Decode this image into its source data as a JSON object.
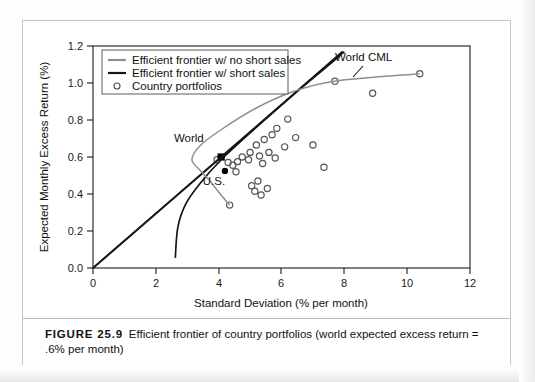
{
  "figure": {
    "caption_label": "FIGURE 25.9",
    "caption_text": "Efficient frontier of country portfolios (world expected excess return = .6% per month)"
  },
  "chart_data": {
    "type": "scatter",
    "title": "",
    "xlabel": "Standard Deviation (% per month)",
    "ylabel": "Expected Monthly Excess Return (%)",
    "xlim": [
      0,
      12
    ],
    "ylim": [
      0.0,
      1.2
    ],
    "xticks": [
      0,
      2,
      4,
      6,
      8,
      10,
      12
    ],
    "xtick_labels": [
      "0",
      "2",
      "4",
      "6",
      "8",
      "10",
      "12"
    ],
    "yticks": [
      0.0,
      0.2,
      0.4,
      0.6,
      0.8,
      1.0,
      1.2
    ],
    "ytick_labels": [
      "0.0",
      "0.2",
      "0.4",
      "0.6",
      "0.8",
      "1.0",
      "1.2"
    ],
    "grid": false,
    "legend_position": "upper-left",
    "legend": [
      {
        "label": "Efficient frontier w/ no short sales",
        "marker": "line",
        "color": "#8e8e8e"
      },
      {
        "label": "Efficient frontier w/ short sales",
        "marker": "line",
        "color": "#151515"
      },
      {
        "label": "Country portfolios",
        "marker": "circle",
        "color": "#4a4a4a"
      }
    ],
    "annotations": [
      {
        "text": "World CML",
        "x": 7.7,
        "y": 1.12
      },
      {
        "text": "World",
        "x": 3.05,
        "y": 0.68
      },
      {
        "text": "U.S.",
        "x": 3.85,
        "y": 0.45
      }
    ],
    "series": [
      {
        "name": "Country portfolios",
        "type": "scatter",
        "marker": "open-circle",
        "color": "#555555",
        "points": [
          [
            4.35,
            0.34
          ],
          [
            4.3,
            0.57
          ],
          [
            4.45,
            0.555
          ],
          [
            4.55,
            0.52
          ],
          [
            4.6,
            0.575
          ],
          [
            4.75,
            0.6
          ],
          [
            4.95,
            0.585
          ],
          [
            5.0,
            0.625
          ],
          [
            5.05,
            0.445
          ],
          [
            5.15,
            0.415
          ],
          [
            5.2,
            0.665
          ],
          [
            5.25,
            0.47
          ],
          [
            5.3,
            0.605
          ],
          [
            5.35,
            0.395
          ],
          [
            5.4,
            0.565
          ],
          [
            5.45,
            0.695
          ],
          [
            5.55,
            0.43
          ],
          [
            5.6,
            0.625
          ],
          [
            5.7,
            0.72
          ],
          [
            5.8,
            0.595
          ],
          [
            5.85,
            0.755
          ],
          [
            6.1,
            0.655
          ],
          [
            6.2,
            0.805
          ],
          [
            6.45,
            0.705
          ],
          [
            7.0,
            0.665
          ],
          [
            7.35,
            0.545
          ],
          [
            7.7,
            1.01
          ],
          [
            8.9,
            0.945
          ],
          [
            10.4,
            1.05
          ],
          [
            3.95,
            0.585
          ]
        ]
      },
      {
        "name": "World",
        "type": "marker",
        "marker": "filled-square",
        "color": "#000000",
        "points": [
          [
            4.08,
            0.6
          ]
        ]
      },
      {
        "name": "U.S.",
        "type": "marker",
        "marker": "filled-circle",
        "color": "#000000",
        "points": [
          [
            4.2,
            0.525
          ]
        ]
      },
      {
        "name": "Efficient frontier w/ short sales",
        "type": "line",
        "color": "#151515",
        "note": "world CML: straight line from origin through the World portfolio",
        "points": [
          [
            0.0,
            0.0
          ],
          [
            4.08,
            0.6
          ],
          [
            7.95,
            1.17
          ]
        ]
      },
      {
        "name": "Efficient frontier w/ short sales (curve)",
        "type": "curve",
        "color": "#151515",
        "note": "hyperbolic frontier with short sales allowed",
        "points": [
          [
            2.62,
            0.055
          ],
          [
            2.7,
            0.22
          ],
          [
            2.95,
            0.345
          ],
          [
            3.4,
            0.455
          ],
          [
            4.08,
            0.585
          ],
          [
            5.1,
            0.745
          ],
          [
            6.3,
            0.925
          ],
          [
            7.6,
            1.11
          ],
          [
            8.0,
            1.17
          ]
        ]
      },
      {
        "name": "Efficient frontier w/ no short sales",
        "type": "curve",
        "color": "#8e8e8e",
        "note": "constrained frontier; kinks at the highest-return country then flattens",
        "points": [
          [
            4.35,
            0.34
          ],
          [
            4.05,
            0.4
          ],
          [
            3.7,
            0.475
          ],
          [
            3.4,
            0.53
          ],
          [
            3.15,
            0.585
          ],
          [
            3.4,
            0.66
          ],
          [
            4.1,
            0.75
          ],
          [
            5.2,
            0.865
          ],
          [
            6.4,
            0.955
          ],
          [
            7.7,
            1.01
          ],
          [
            10.4,
            1.05
          ]
        ]
      }
    ]
  }
}
